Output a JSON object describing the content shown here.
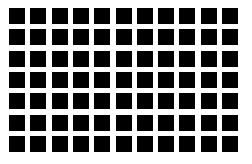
{
  "figure": {
    "name": "hermann-grid-illusion",
    "canvas": {
      "width": 252,
      "height": 164,
      "background_color": "#ffffff"
    }
  },
  "grid": {
    "columns": 11,
    "rows": 7,
    "total_cells": 77,
    "cell": {
      "shape": "square",
      "width": 16,
      "height": 16,
      "fill_color": "#000000"
    },
    "spacing": {
      "column_pitch": 21.3,
      "row_pitch": 21.3,
      "gap_width": 5.3,
      "gap_color": "#ffffff"
    },
    "margins": {
      "left": 9,
      "top": 8,
      "right": 9,
      "bottom": 12
    },
    "column_x": [
      9,
      30.3,
      51.6,
      72.9,
      94.2,
      115.5,
      136.8,
      158.1,
      179.4,
      200.7,
      222
    ],
    "row_y": [
      8,
      29.3,
      50.6,
      71.9,
      93.2,
      114.5,
      135.8
    ],
    "row_labels": [
      "row-1",
      "row-2",
      "row-3",
      "row-4",
      "row-5",
      "row-6",
      "row-7"
    ],
    "column_labels": [
      "col-1",
      "col-2",
      "col-3",
      "col-4",
      "col-5",
      "col-6",
      "col-7",
      "col-8",
      "col-9",
      "col-10",
      "col-11"
    ]
  },
  "palette": {
    "foreground": "#000000",
    "background": "#ffffff"
  }
}
